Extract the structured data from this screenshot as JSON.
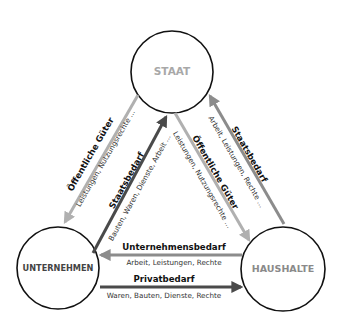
{
  "nodes": {
    "staat": {
      "label": "STAAT",
      "color": "#a8a8a8"
    },
    "unternehmen": {
      "label": "UNTERNEHMEN",
      "color": "#444444"
    },
    "haushalte": {
      "label": "HAUSHALTE",
      "color": "#8a8a8a"
    }
  },
  "flows": {
    "staat_to_unternehmen": {
      "from": "STAAT",
      "to": "UNTERNEHMEN",
      "title": "Öffentliche Güter",
      "subtitle": "Leistungen, Nutzungsrechte ...",
      "color": "#b0b0b0"
    },
    "unternehmen_to_staat": {
      "from": "UNTERNEHMEN",
      "to": "STAAT",
      "title": "Staatsbedarf",
      "subtitle": "Bauten, Waren, Dienste, Arbeit ...",
      "color": "#4a4a4a"
    },
    "staat_to_haushalte": {
      "from": "STAAT",
      "to": "HAUSHALTE",
      "title": "Öffentliche Güter",
      "subtitle": "Leistungen, Nutzungsrechte ...",
      "color": "#b0b0b0"
    },
    "haushalte_to_staat": {
      "from": "HAUSHALTE",
      "to": "STAAT",
      "title": "Staatsbedarf",
      "subtitle": "Arbeit, Leistungen, Rechte ...",
      "color": "#8c8c8c"
    },
    "haushalte_to_unternehmen": {
      "from": "HAUSHALTE",
      "to": "UNTERNEHMEN",
      "title": "Unternehmensbedarf",
      "subtitle": "Arbeit, Leistungen, Rechte",
      "color": "#8c8c8c"
    },
    "unternehmen_to_haushalte": {
      "from": "UNTERNEHMEN",
      "to": "HAUSHALTE",
      "title": "Privatbedarf",
      "subtitle": "Waren, Bauten, Dienste, Rechte",
      "color": "#4a4a4a"
    }
  }
}
